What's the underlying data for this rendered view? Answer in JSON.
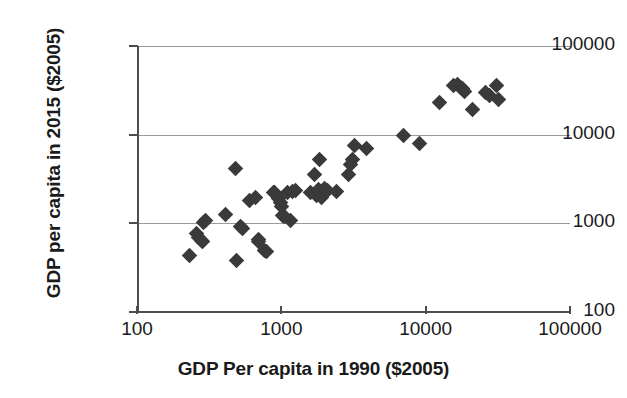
{
  "chart_data": {
    "type": "scatter",
    "title": "",
    "xlabel": "GDP Per capita in 1990 ($2005)",
    "ylabel": "GDP per capita in 2015 ($2005)",
    "xscale": "log",
    "yscale": "log",
    "xlim": [
      100,
      100000
    ],
    "ylim": [
      100,
      100000
    ],
    "xticks": [
      100,
      1000,
      10000,
      100000
    ],
    "yticks": [
      100,
      1000,
      10000,
      100000
    ],
    "xtick_labels": [
      "100",
      "1000",
      "10000",
      "100000"
    ],
    "ytick_labels": [
      "100",
      "1000",
      "10000",
      "100000"
    ],
    "grid": true,
    "grid_axis": "y",
    "legend": false,
    "marker": "diamond",
    "marker_color": "#3a3a3a",
    "series": [
      {
        "name": "Countries",
        "points": [
          [
            230,
            430
          ],
          [
            260,
            760
          ],
          [
            268,
            700
          ],
          [
            280,
            640
          ],
          [
            285,
            620
          ],
          [
            290,
            1020
          ],
          [
            300,
            1080
          ],
          [
            410,
            1250
          ],
          [
            480,
            4100
          ],
          [
            490,
            380
          ],
          [
            520,
            930
          ],
          [
            540,
            880
          ],
          [
            600,
            1800
          ],
          [
            660,
            1950
          ],
          [
            690,
            660
          ],
          [
            700,
            620
          ],
          [
            760,
            500
          ],
          [
            790,
            480
          ],
          [
            880,
            2250
          ],
          [
            900,
            2200
          ],
          [
            950,
            1900
          ],
          [
            980,
            1700
          ],
          [
            1000,
            1560
          ],
          [
            1020,
            1230
          ],
          [
            1050,
            1180
          ],
          [
            1100,
            2200
          ],
          [
            1150,
            1080
          ],
          [
            1200,
            2300
          ],
          [
            1250,
            2350
          ],
          [
            1600,
            2250
          ],
          [
            1700,
            3550
          ],
          [
            1750,
            2050
          ],
          [
            1800,
            2400
          ],
          [
            1850,
            5300
          ],
          [
            1900,
            1950
          ],
          [
            2000,
            2450
          ],
          [
            2100,
            2350
          ],
          [
            2400,
            2300
          ],
          [
            2900,
            3600
          ],
          [
            3000,
            4600
          ],
          [
            3100,
            5200
          ],
          [
            3200,
            7600
          ],
          [
            3900,
            6900
          ],
          [
            7000,
            9900
          ],
          [
            9000,
            7900
          ],
          [
            12500,
            23000
          ],
          [
            15500,
            36000
          ],
          [
            16500,
            37000
          ],
          [
            17500,
            34000
          ],
          [
            18000,
            33000
          ],
          [
            18500,
            31000
          ],
          [
            21000,
            19000
          ],
          [
            26000,
            30000
          ],
          [
            27500,
            28000
          ],
          [
            31000,
            36000
          ],
          [
            32000,
            25000
          ]
        ]
      }
    ]
  }
}
